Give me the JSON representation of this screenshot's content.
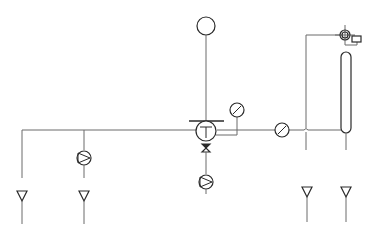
{
  "diagram": {
    "type": "process-flow-schematic",
    "line_color": "#6a6a6a",
    "symbol_color": "#2a2a2a",
    "background": "#ffffff",
    "symbols": [
      {
        "id": "top-instrument",
        "kind": "circle-instrument",
        "label": ""
      },
      {
        "id": "main-vessel",
        "kind": "circle-with-T",
        "glyph": "T"
      },
      {
        "id": "bottom-valve",
        "kind": "bowtie-valve"
      },
      {
        "id": "gauge-1",
        "kind": "circle-slash"
      },
      {
        "id": "gauge-2",
        "kind": "circle-slash"
      },
      {
        "id": "pump-left",
        "kind": "pump"
      },
      {
        "id": "pump-center",
        "kind": "pump"
      },
      {
        "id": "column",
        "kind": "vertical-column"
      },
      {
        "id": "column-top-instrument",
        "kind": "double-circle-crosshair"
      },
      {
        "id": "column-box",
        "kind": "rectangle"
      },
      {
        "id": "outlet-1",
        "kind": "triangle-down"
      },
      {
        "id": "outlet-2",
        "kind": "triangle-down"
      },
      {
        "id": "outlet-3",
        "kind": "triangle-down"
      },
      {
        "id": "outlet-4",
        "kind": "triangle-down"
      }
    ]
  }
}
